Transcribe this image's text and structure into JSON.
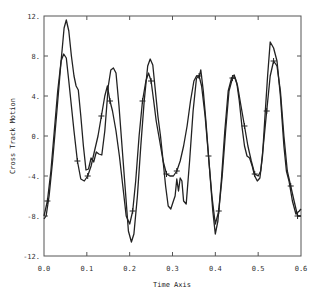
{
  "chart_data": {
    "type": "line",
    "title": "",
    "xlabel": "Time Axis",
    "ylabel": "Cross Track Motion",
    "xlim": [
      0.0,
      0.6
    ],
    "ylim": [
      -12,
      12
    ],
    "xticks": [
      0.0,
      0.1,
      0.2,
      0.3,
      0.4,
      0.5,
      0.6
    ],
    "xtick_labels": [
      "0.0",
      "0.1",
      "0.2",
      "0.3",
      "0.4",
      "0.5",
      "0.6"
    ],
    "yticks": [
      12,
      8,
      4,
      0,
      -4,
      -8,
      -12
    ],
    "ytick_labels": [
      "12.",
      "8.",
      "4.",
      "0.",
      "-4.",
      "-8.",
      "-12."
    ],
    "grid": false,
    "legend": null,
    "series": [
      {
        "name": "trace-solid",
        "marker": "none",
        "x": [
          0.0,
          0.005,
          0.012,
          0.02,
          0.03,
          0.04,
          0.047,
          0.052,
          0.058,
          0.064,
          0.07,
          0.075,
          0.08,
          0.086,
          0.092,
          0.098,
          0.104,
          0.11,
          0.116,
          0.122,
          0.128,
          0.135,
          0.142,
          0.15,
          0.156,
          0.162,
          0.168,
          0.175,
          0.182,
          0.19,
          0.197,
          0.204,
          0.21,
          0.218,
          0.226,
          0.234,
          0.242,
          0.248,
          0.254,
          0.26,
          0.266,
          0.272,
          0.278,
          0.284,
          0.29,
          0.296,
          0.302,
          0.306,
          0.31,
          0.314,
          0.318,
          0.322,
          0.326,
          0.332,
          0.34,
          0.348,
          0.356,
          0.362,
          0.366,
          0.372,
          0.378,
          0.386,
          0.394,
          0.4,
          0.406,
          0.414,
          0.422,
          0.43,
          0.438,
          0.444,
          0.45,
          0.456,
          0.462,
          0.468,
          0.474,
          0.48,
          0.486,
          0.492,
          0.498,
          0.504,
          0.51,
          0.516,
          0.522,
          0.528,
          0.536,
          0.544,
          0.552,
          0.56,
          0.566,
          0.572,
          0.58,
          0.588,
          0.596,
          0.6
        ],
        "y": [
          -8.3,
          -8.0,
          -6.0,
          -2.5,
          2.5,
          7.5,
          10.8,
          11.6,
          10.5,
          8.0,
          6.0,
          5.0,
          4.6,
          2.0,
          -1.0,
          -3.4,
          -3.3,
          -2.2,
          -2.6,
          -1.6,
          -1.8,
          -1.9,
          0.5,
          5.0,
          6.6,
          6.8,
          6.3,
          3.0,
          -1.0,
          -5.5,
          -9.5,
          -10.6,
          -9.8,
          -6.0,
          -1.0,
          3.5,
          7.0,
          7.7,
          7.1,
          4.5,
          2.0,
          0.0,
          -2.5,
          -5.0,
          -7.0,
          -7.3,
          -6.5,
          -6.0,
          -4.3,
          -5.5,
          -4.2,
          -4.5,
          -6.5,
          -6.8,
          -2.5,
          2.5,
          5.8,
          5.9,
          6.6,
          4.5,
          1.5,
          -3.0,
          -7.5,
          -9.8,
          -8.5,
          -4.5,
          0.5,
          4.5,
          5.8,
          6.1,
          5.3,
          3.5,
          1.0,
          -1.0,
          -2.0,
          -2.2,
          -3.0,
          -4.0,
          -4.5,
          -4.2,
          -2.0,
          2.0,
          6.0,
          9.4,
          8.8,
          7.5,
          4.0,
          -1.0,
          -3.5,
          -4.5,
          -6.5,
          -7.8,
          -7.5,
          -7.3
        ]
      },
      {
        "name": "trace-marked",
        "marker": "+",
        "x": [
          0.0,
          0.008,
          0.016,
          0.024,
          0.032,
          0.04,
          0.046,
          0.052,
          0.058,
          0.064,
          0.07,
          0.078,
          0.086,
          0.094,
          0.102,
          0.11,
          0.118,
          0.126,
          0.134,
          0.142,
          0.148,
          0.154,
          0.16,
          0.168,
          0.176,
          0.184,
          0.192,
          0.2,
          0.207,
          0.214,
          0.222,
          0.23,
          0.238,
          0.244,
          0.25,
          0.256,
          0.262,
          0.27,
          0.278,
          0.286,
          0.294,
          0.302,
          0.31,
          0.318,
          0.326,
          0.334,
          0.342,
          0.35,
          0.356,
          0.362,
          0.368,
          0.376,
          0.384,
          0.392,
          0.4,
          0.408,
          0.416,
          0.424,
          0.432,
          0.44,
          0.446,
          0.452,
          0.46,
          0.468,
          0.476,
          0.484,
          0.492,
          0.5,
          0.506,
          0.512,
          0.52,
          0.528,
          0.536,
          0.544,
          0.552,
          0.56,
          0.568,
          0.576,
          0.584,
          0.592,
          0.6
        ],
        "y": [
          -8.0,
          -6.5,
          -3.5,
          0.5,
          4.5,
          7.5,
          8.2,
          7.8,
          5.5,
          3.0,
          0.5,
          -2.5,
          -4.3,
          -4.5,
          -4.0,
          -3.0,
          -1.5,
          0.0,
          2.0,
          4.0,
          5.0,
          3.5,
          2.5,
          0.5,
          -2.0,
          -5.0,
          -8.0,
          -8.8,
          -7.5,
          -4.5,
          0.0,
          3.5,
          5.5,
          6.3,
          5.5,
          3.5,
          1.5,
          -0.5,
          -2.5,
          -3.8,
          -4.0,
          -4.0,
          -3.5,
          -2.5,
          -1.0,
          1.0,
          3.5,
          5.5,
          6.0,
          6.0,
          5.0,
          2.0,
          -2.0,
          -6.0,
          -8.8,
          -7.5,
          -4.0,
          0.5,
          4.5,
          5.8,
          5.8,
          5.0,
          3.0,
          1.0,
          -1.0,
          -2.5,
          -3.8,
          -4.0,
          -3.5,
          -1.0,
          2.5,
          6.0,
          7.5,
          7.0,
          4.5,
          0.0,
          -3.5,
          -5.0,
          -6.5,
          -8.0,
          -8.0
        ],
        "marker_indices": [
          1,
          11,
          14,
          18,
          21,
          28,
          31,
          34,
          39,
          42,
          49,
          52,
          55,
          59,
          63,
          66,
          70,
          72,
          77,
          79
        ]
      }
    ]
  }
}
